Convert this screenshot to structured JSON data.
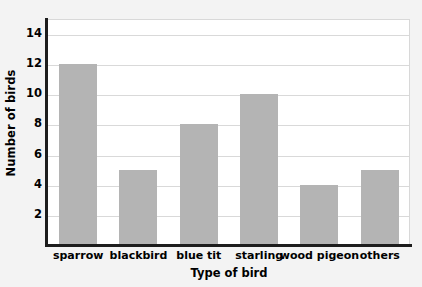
{
  "chart_data": {
    "type": "bar",
    "title": "",
    "xlabel": "Type of bird",
    "ylabel": "Number of birds",
    "categories": [
      "sparrow",
      "blackbird",
      "blue tit",
      "starling",
      "wood pigeon",
      "others"
    ],
    "values": [
      12,
      5,
      8,
      10,
      4,
      5
    ],
    "series": [
      {
        "name": "Number of birds",
        "values": [
          12,
          5,
          8,
          10,
          4,
          5
        ]
      }
    ],
    "ylim": [
      0,
      15
    ],
    "ytick_labels": [
      "2",
      "4",
      "6",
      "8",
      "10",
      "12",
      "14"
    ],
    "ytick_values": [
      2,
      4,
      6,
      8,
      10,
      12,
      14
    ],
    "grid": "horizontal",
    "legend": "none",
    "bar_color": "#b4b4b4",
    "plot_background": "#ffffff",
    "page_background": "#f3f3f3",
    "axis_color": "#1d1d1d",
    "gridline_color": "#d9d9d9"
  }
}
